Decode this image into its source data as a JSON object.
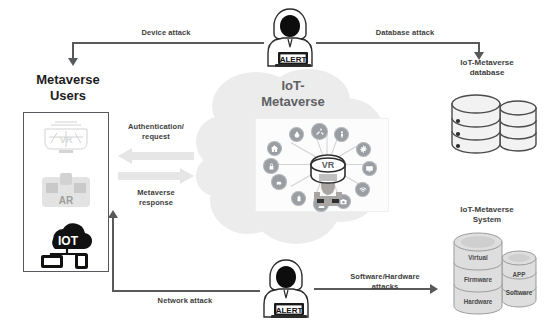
{
  "diagram": {
    "colors": {
      "ink": "#3d3d3d",
      "line": "#58595b",
      "cloud": "#ededed",
      "node": "#9a9ea3",
      "block_arrow": "#e2e2e2",
      "cylinder": "#d9d9d9",
      "background": "#ffffff"
    }
  },
  "users_panel": {
    "title_line1": "Metaverse",
    "title_line2": "Users",
    "icons": [
      {
        "name": "vr-icon",
        "label": "VR"
      },
      {
        "name": "ar-icon",
        "label": "AR"
      },
      {
        "name": "iot-icon",
        "label": "IOT"
      }
    ]
  },
  "cloud": {
    "title_line1": "IoT-",
    "title_line2": "Metaverse",
    "hub_label": "VR",
    "nodes": [
      {
        "name": "node-home-icon",
        "label": "home"
      },
      {
        "name": "node-water-drop-icon",
        "label": "drop"
      },
      {
        "name": "node-tools-icon",
        "label": "tools"
      },
      {
        "name": "node-person-icon",
        "label": "person"
      },
      {
        "name": "node-gear-icon",
        "label": "gear"
      },
      {
        "name": "node-monitor-icon",
        "label": "monitor"
      },
      {
        "name": "node-wifi-icon",
        "label": "wifi"
      },
      {
        "name": "node-camera-icon",
        "label": "camera"
      },
      {
        "name": "node-user-icon",
        "label": "user"
      },
      {
        "name": "node-battery-icon",
        "label": "battery"
      },
      {
        "name": "node-car-icon",
        "label": "car"
      },
      {
        "name": "node-lock-icon",
        "label": "lock"
      }
    ]
  },
  "database": {
    "title_line1": "IoT-Metaverse",
    "title_line2": "database"
  },
  "system": {
    "title_line1": "IoT-Metaverse",
    "title_line2": "System",
    "left_stack": [
      "Virtual",
      "Firmware",
      "Hardware"
    ],
    "right_stack": [
      "APP",
      "Software"
    ]
  },
  "flows": {
    "device_attack": "Device attack",
    "database_attack": "Database attack",
    "network_attack": "Network attack",
    "software_hardware_attacks_line1": "Software/Hardware",
    "software_hardware_attacks_line2": "attacks",
    "authentication_line1": "Authentication/",
    "authentication_line2": "request",
    "metaverse_response_line1": "Metaverse",
    "metaverse_response_line2": "response"
  },
  "attackers": [
    {
      "name": "attacker-top",
      "screen_label": "ALERT"
    },
    {
      "name": "attacker-bottom",
      "screen_label": "ALERT"
    }
  ]
}
